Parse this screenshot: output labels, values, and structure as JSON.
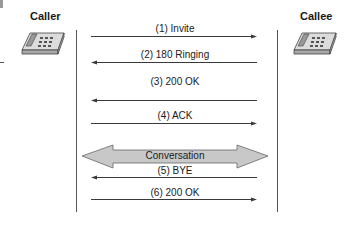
{
  "participants": {
    "caller": {
      "label": "Caller",
      "icon": "telephone-icon"
    },
    "callee": {
      "label": "Callee",
      "icon": "telephone-icon"
    }
  },
  "messages": [
    {
      "label": "(1) Invite",
      "direction": "right",
      "y": 36
    },
    {
      "label": "(2) 180 Ringing",
      "direction": "left",
      "y": 62
    },
    {
      "label": "(3) 200 OK",
      "direction": "left",
      "y": 101
    },
    {
      "label": "(4) ACK",
      "direction": "right",
      "y": 123
    },
    {
      "label": "(5) BYE",
      "direction": "left",
      "y": 177
    },
    {
      "label": "(6) 200 OK",
      "direction": "right",
      "y": 199
    }
  ],
  "conversation": {
    "label": "Conversation",
    "type": "bidirectional",
    "fill": "#c8c8c8"
  },
  "colors": {
    "line": "#3a3a3a",
    "text": "#1a1a1a",
    "arrow_fill": "#c8c8c8"
  }
}
